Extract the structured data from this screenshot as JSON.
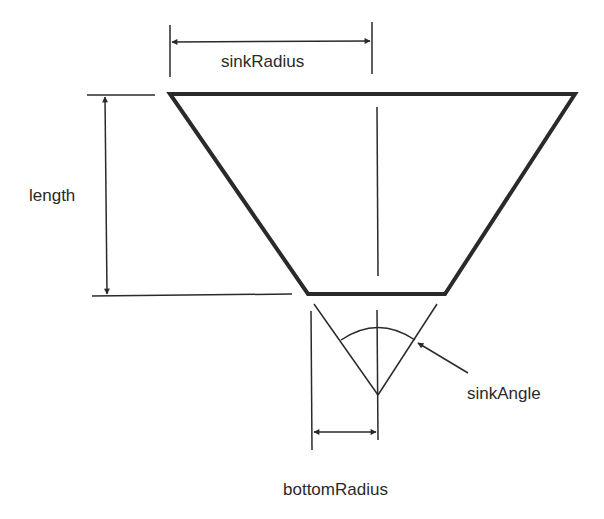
{
  "diagram": {
    "labels": {
      "sink_radius": "sinkRadius",
      "length": "length",
      "sink_angle": "sinkAngle",
      "bottom_radius": "bottomRadius"
    },
    "colors": {
      "ink": "#2a2a2a",
      "background": "#ffffff"
    },
    "shapes": {
      "trapezoid": {
        "top_left": [
          170,
          94
        ],
        "top_right": [
          575,
          94
        ],
        "bottom_right": [
          445,
          294
        ],
        "bottom_left": [
          308,
          294
        ]
      },
      "centerline_x": 377,
      "apex": [
        378,
        395
      ]
    }
  }
}
